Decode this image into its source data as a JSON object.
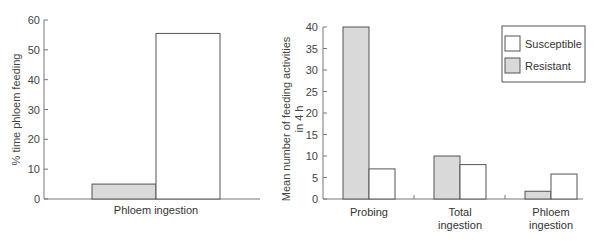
{
  "colors": {
    "resistant": "#d9d9d9",
    "susceptible": "#ffffff",
    "stroke": "#555555",
    "axis": "#777777"
  },
  "legend": {
    "items": [
      {
        "label": "Susceptible",
        "color": "#ffffff"
      },
      {
        "label": "Resistant",
        "color": "#d9d9d9"
      }
    ]
  },
  "chart_data": [
    {
      "type": "bar",
      "title": "",
      "xlabel": "",
      "ylabel": "% time phloem feeding",
      "ylim": [
        0,
        60
      ],
      "yticks": [
        0,
        10,
        20,
        30,
        40,
        50,
        60
      ],
      "categories": [
        "Phloem ingestion"
      ],
      "series": [
        {
          "name": "Resistant",
          "values": [
            5
          ]
        },
        {
          "name": "Susceptible",
          "values": [
            55.5
          ]
        }
      ],
      "grid": false
    },
    {
      "type": "bar",
      "title": "",
      "xlabel": "",
      "ylabel": "Mean number of feeding activities in 4 h",
      "ylabel_lines": [
        "Mean number of feeding activities",
        "in 4 h"
      ],
      "ylim": [
        0,
        40
      ],
      "yticks": [
        0,
        5,
        10,
        15,
        20,
        25,
        30,
        35,
        40
      ],
      "categories": [
        "Probing",
        "Total ingestion",
        "Phloem ingestion"
      ],
      "category_lines": [
        [
          "Probing"
        ],
        [
          "Total",
          "ingestion"
        ],
        [
          "Phloem",
          "ingestion"
        ]
      ],
      "series": [
        {
          "name": "Resistant",
          "values": [
            40,
            10,
            1.8
          ]
        },
        {
          "name": "Susceptible",
          "values": [
            7,
            8,
            5.8
          ]
        }
      ],
      "legend_position": "upper right",
      "grid": false
    }
  ]
}
